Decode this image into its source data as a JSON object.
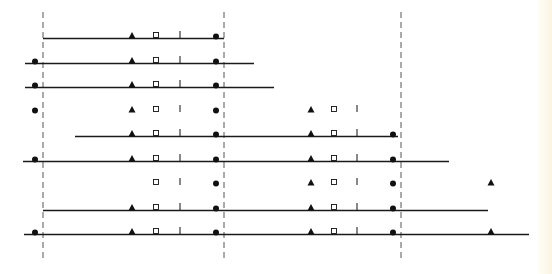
{
  "diagram": {
    "colors": {
      "line": "#1a1a1a",
      "dashed": "#555555",
      "marker": "#111111",
      "tint_blue": "#2a2f8a",
      "tint_green": "#3d8a3a",
      "tint_red": "#b0304a"
    },
    "marker_types": [
      "filled-circle",
      "filled-triangle",
      "open-square",
      "tick"
    ],
    "reference_lines": [
      {
        "id": "ref-1",
        "style": "dashed"
      },
      {
        "id": "ref-2",
        "style": "dashed"
      },
      {
        "id": "ref-3",
        "style": "dashed"
      }
    ],
    "tracks": [
      {
        "index": 1,
        "start": 43,
        "end": 224,
        "tint": null,
        "markers": [
          [
            "triangle",
            132
          ],
          [
            "square",
            156
          ],
          [
            "tick",
            180
          ],
          [
            "circle",
            216
          ]
        ]
      },
      {
        "index": 2,
        "start": 25,
        "end": 254,
        "tint": null,
        "markers": [
          [
            "circle",
            35
          ],
          [
            "triangle",
            132
          ],
          [
            "square",
            156
          ],
          [
            "tick",
            180
          ],
          [
            "circle",
            216
          ]
        ]
      },
      {
        "index": 3,
        "start": 25,
        "end": 274,
        "tint": null,
        "markers": [
          [
            "circle",
            35
          ],
          [
            "triangle",
            132
          ],
          [
            "square",
            156
          ],
          [
            "tick",
            180
          ],
          [
            "circle",
            216
          ]
        ]
      },
      {
        "index": 4,
        "start": 25,
        "end": 371,
        "tint": "blue",
        "markers": [
          [
            "circle",
            35
          ],
          [
            "triangle",
            132
          ],
          [
            "square",
            156
          ],
          [
            "tick",
            180
          ],
          [
            "circle",
            216
          ],
          [
            "triangle",
            311
          ],
          [
            "square",
            334
          ],
          [
            "tick",
            357
          ]
        ]
      },
      {
        "index": 5,
        "start": 75,
        "end": 398,
        "tint": null,
        "markers": [
          [
            "triangle",
            132
          ],
          [
            "square",
            156
          ],
          [
            "tick",
            180
          ],
          [
            "circle",
            216
          ],
          [
            "triangle",
            311
          ],
          [
            "square",
            334
          ],
          [
            "tick",
            357
          ],
          [
            "circle",
            393
          ]
        ]
      },
      {
        "index": 6,
        "start": 23,
        "end": 449,
        "tint": null,
        "markers": [
          [
            "circle",
            35
          ],
          [
            "triangle",
            132
          ],
          [
            "square",
            156
          ],
          [
            "tick",
            180
          ],
          [
            "circle",
            216
          ],
          [
            "triangle",
            311
          ],
          [
            "square",
            334
          ],
          [
            "tick",
            357
          ],
          [
            "circle",
            393
          ]
        ]
      },
      {
        "index": 7,
        "start": 148,
        "end": 502,
        "tint": "gradient",
        "markers": [
          [
            "square",
            156
          ],
          [
            "tick",
            180
          ],
          [
            "circle",
            216
          ],
          [
            "triangle",
            311
          ],
          [
            "square",
            334
          ],
          [
            "tick",
            357
          ],
          [
            "circle",
            393
          ],
          [
            "triangle",
            491
          ]
        ]
      },
      {
        "index": 8,
        "start": 43,
        "end": 488,
        "tint": null,
        "markers": [
          [
            "triangle",
            132
          ],
          [
            "square",
            156
          ],
          [
            "tick",
            180
          ],
          [
            "circle",
            216
          ],
          [
            "triangle",
            311
          ],
          [
            "square",
            334
          ],
          [
            "tick",
            357
          ],
          [
            "circle",
            393
          ]
        ]
      },
      {
        "index": 9,
        "start": 24,
        "end": 529,
        "tint": null,
        "markers": [
          [
            "circle",
            35
          ],
          [
            "triangle",
            132
          ],
          [
            "square",
            156
          ],
          [
            "tick",
            180
          ],
          [
            "circle",
            216
          ],
          [
            "triangle",
            311
          ],
          [
            "square",
            334
          ],
          [
            "tick",
            357
          ],
          [
            "circle",
            393
          ],
          [
            "triangle",
            491
          ]
        ]
      }
    ]
  }
}
